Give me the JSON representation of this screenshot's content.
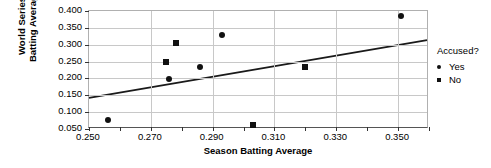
{
  "chart_data": {
    "type": "scatter",
    "title": "",
    "xlabel": "Season Batting Average",
    "ylabel": "World Series\nBatting Average",
    "xlim": [
      0.25,
      0.36
    ],
    "ylim": [
      0.05,
      0.4
    ],
    "xticks": [
      "0.250",
      "0.270",
      "0.290",
      "0.310",
      "0.330",
      "0.350"
    ],
    "xtick_values": [
      0.25,
      0.27,
      0.29,
      0.31,
      0.33,
      0.35
    ],
    "xminor_values": [
      0.26,
      0.28,
      0.3,
      0.32,
      0.34,
      0.36
    ],
    "yticks": [
      "0.400",
      "0.350",
      "0.300",
      "0.250",
      "0.200",
      "0.150",
      "0.100",
      "0.050"
    ],
    "ytick_values": [
      0.4,
      0.35,
      0.3,
      0.25,
      0.2,
      0.15,
      0.1,
      0.05
    ],
    "grid": true,
    "legend_position": "right",
    "legend": {
      "title": "Accused?",
      "entries": [
        {
          "label": "Yes",
          "marker": "circle"
        },
        {
          "label": "No",
          "marker": "square"
        }
      ]
    },
    "series": [
      {
        "name": "Yes",
        "marker": "circle",
        "color": "#111111",
        "points": [
          {
            "x": 0.256,
            "y": 0.077
          },
          {
            "x": 0.276,
            "y": 0.198
          },
          {
            "x": 0.286,
            "y": 0.235
          },
          {
            "x": 0.293,
            "y": 0.328
          },
          {
            "x": 0.351,
            "y": 0.385
          }
        ]
      },
      {
        "name": "No",
        "marker": "square",
        "color": "#111111",
        "points": [
          {
            "x": 0.275,
            "y": 0.25
          },
          {
            "x": 0.278,
            "y": 0.305
          },
          {
            "x": 0.303,
            "y": 0.063
          },
          {
            "x": 0.32,
            "y": 0.235
          }
        ]
      }
    ],
    "trendline": {
      "x_start": 0.25,
      "y_start": 0.138,
      "x_end": 0.36,
      "y_end": 0.312,
      "color": "#1a1a1a",
      "width": 1.8
    }
  }
}
